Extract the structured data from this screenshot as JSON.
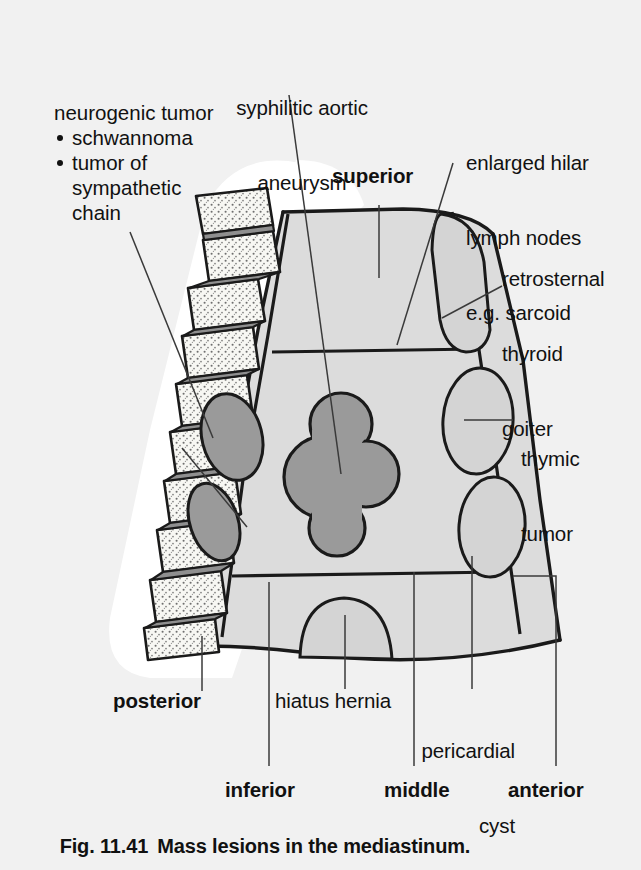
{
  "figure": {
    "number": "Fig. 11.41",
    "title": "Mass lesions in the mediastinum."
  },
  "colors": {
    "background": "#f1f1f1",
    "body_fill": "#dcdcdc",
    "halo": "#ffffff",
    "bone_fill": "#f7f7f3",
    "disc_fill": "#8f8f8f",
    "mass_dark": "#9a9a9a",
    "mass_light": "#d4d4d4",
    "stroke": "#1a1a1a",
    "leader": "#333333"
  },
  "labels": {
    "neurogenic": {
      "heading": "neurogenic tumor",
      "items": [
        "schwannoma",
        "tumor of",
        "sympathetic",
        "chain"
      ]
    },
    "aneurysm": [
      "syphilitic aortic",
      "aneurysm"
    ],
    "hilar": [
      "enlarged hilar",
      "lymph nodes",
      "e.g. sarcoid"
    ],
    "thyroid": [
      "retrosternal",
      "thyroid",
      "goiter"
    ],
    "thymic": [
      "thymic",
      "tumor"
    ],
    "hiatus": "hiatus hernia",
    "pericardial": [
      "pericardial",
      "cyst"
    ],
    "compartments": {
      "superior": "superior",
      "posterior": "posterior",
      "inferior": "inferior",
      "middle": "middle",
      "anterior": "anterior"
    }
  },
  "diagram": {
    "type": "anatomical-illustration",
    "compartments": [
      "superior",
      "anterior",
      "middle",
      "posterior",
      "inferior"
    ],
    "structures": [
      {
        "name": "vertebral-column",
        "side": "left",
        "vertebrae": 9,
        "shade": "light"
      },
      {
        "name": "neurogenic-tumor-upper",
        "shade": "dark"
      },
      {
        "name": "neurogenic-tumor-lower",
        "shade": "dark"
      },
      {
        "name": "syphilitic-aortic-aneurysm",
        "shade": "dark",
        "form": "lobulated"
      },
      {
        "name": "retrosternal-thyroid-goiter",
        "shade": "light"
      },
      {
        "name": "thymic-tumor",
        "shade": "light",
        "form": "ellipse"
      },
      {
        "name": "pericardial-cyst",
        "shade": "light",
        "form": "ellipse"
      },
      {
        "name": "hiatus-hernia",
        "shade": "light",
        "form": "dome"
      }
    ]
  }
}
